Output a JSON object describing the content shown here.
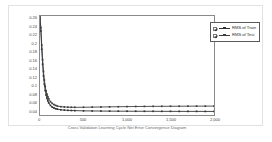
{
  "chart_data": {
    "type": "line",
    "title": "",
    "xlabel": "Cross Validation Learning Cycle Net Error Convergence Diagram",
    "ylabel": "",
    "xlim": [
      0,
      2000
    ],
    "ylim": [
      0.03,
      0.268
    ],
    "grid": false,
    "legend_position": "upper-right-outside",
    "x_ticks": [
      {
        "value": 0,
        "label": "0"
      },
      {
        "value": 500,
        "label": "500"
      },
      {
        "value": 1000,
        "label": "1,000"
      },
      {
        "value": 1500,
        "label": "1,500"
      },
      {
        "value": 2000,
        "label": "2,000"
      }
    ],
    "y_ticks": [
      {
        "value": 0.26,
        "label": "0.26"
      },
      {
        "value": 0.24,
        "label": "0.24"
      },
      {
        "value": 0.22,
        "label": "0.22"
      },
      {
        "value": 0.2,
        "label": "0.2"
      },
      {
        "value": 0.18,
        "label": "0.18"
      },
      {
        "value": 0.16,
        "label": "0.16"
      },
      {
        "value": 0.14,
        "label": "0.14"
      },
      {
        "value": 0.12,
        "label": "0.12"
      },
      {
        "value": 0.1,
        "label": "0.1"
      },
      {
        "value": 0.08,
        "label": "0.08"
      },
      {
        "value": 0.06,
        "label": "0.06"
      },
      {
        "value": 0.04,
        "label": "0.04"
      }
    ],
    "series": [
      {
        "name": "RMS of Train",
        "color": "#303030",
        "marker": "square",
        "x": [
          0,
          10,
          20,
          30,
          40,
          50,
          60,
          70,
          80,
          90,
          100,
          120,
          140,
          160,
          180,
          200,
          240,
          280,
          320,
          360,
          400,
          500,
          600,
          700,
          800,
          900,
          1000,
          1100,
          1200,
          1300,
          1400,
          1500,
          1600,
          1700,
          1800,
          1900,
          2000
        ],
        "y": [
          0.262,
          0.232,
          0.188,
          0.152,
          0.124,
          0.104,
          0.089,
          0.078,
          0.07,
          0.064,
          0.059,
          0.053,
          0.049,
          0.047,
          0.045,
          0.044,
          0.0425,
          0.0418,
          0.0412,
          0.0408,
          0.0405,
          0.04,
          0.0397,
          0.0395,
          0.0393,
          0.0392,
          0.0391,
          0.039,
          0.0389,
          0.0389,
          0.0388,
          0.0388,
          0.0387,
          0.0387,
          0.0387,
          0.0386,
          0.0386
        ]
      },
      {
        "name": "RMS of Test",
        "color": "#3c3c3c",
        "marker": "square",
        "x": [
          0,
          10,
          20,
          30,
          40,
          50,
          60,
          70,
          80,
          90,
          100,
          120,
          140,
          160,
          180,
          200,
          240,
          280,
          320,
          360,
          400,
          500,
          600,
          700,
          800,
          900,
          1000,
          1100,
          1200,
          1300,
          1400,
          1500,
          1600,
          1700,
          1800,
          1900,
          2000
        ],
        "y": [
          0.266,
          0.24,
          0.198,
          0.163,
          0.135,
          0.114,
          0.099,
          0.088,
          0.08,
          0.074,
          0.069,
          0.062,
          0.058,
          0.055,
          0.053,
          0.0515,
          0.05,
          0.0492,
          0.0488,
          0.0486,
          0.0485,
          0.0486,
          0.0489,
          0.0492,
          0.0496,
          0.0499,
          0.0502,
          0.0504,
          0.0506,
          0.0508,
          0.0509,
          0.051,
          0.0511,
          0.0512,
          0.0513,
          0.0513,
          0.0514
        ]
      }
    ]
  },
  "legend": {
    "items": [
      {
        "label": "RMS of Train",
        "checked": true
      },
      {
        "label": "RMS of Test",
        "checked": true
      }
    ]
  },
  "caption": {
    "text": ""
  }
}
